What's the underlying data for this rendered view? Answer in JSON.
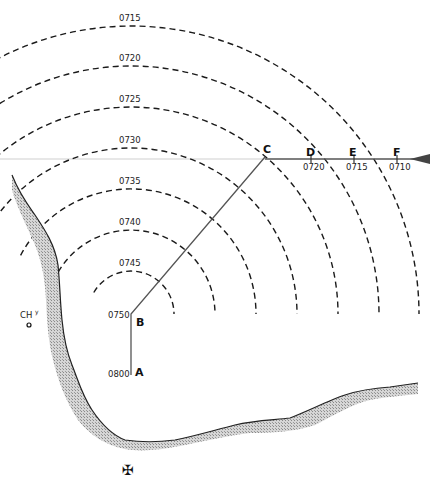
{
  "title": "",
  "arcs": [
    {
      "label": "0745"
    },
    {
      "label": "0740"
    },
    {
      "label": "0735"
    },
    {
      "label": "0730"
    },
    {
      "label": "0725"
    },
    {
      "label": "0720"
    },
    {
      "label": "0715"
    }
  ],
  "track_points": [
    {
      "name": "A",
      "time": "0800"
    },
    {
      "name": "B",
      "time": "0750"
    },
    {
      "name": "C",
      "time": ""
    }
  ],
  "baseline_points": [
    {
      "name": "D",
      "time": "0720"
    },
    {
      "name": "E",
      "time": "0715"
    },
    {
      "name": "F",
      "time": "0710"
    }
  ],
  "landmarks": {
    "church_label": "CH",
    "church_superscript": "y",
    "cross_symbol": "✠"
  },
  "colors": {
    "ink": "#1a1a1a",
    "track": "#555555",
    "baseline": "#cfcfcf",
    "coast_fill": "#b0b0b0"
  }
}
